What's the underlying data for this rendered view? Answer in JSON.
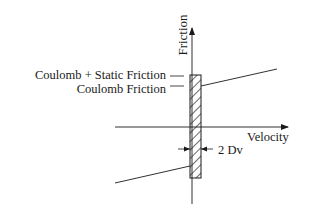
{
  "diagram": {
    "axes": {
      "y_label": "Friction",
      "x_label": "Velocity"
    },
    "labels": {
      "coulomb_static": "Coulomb + Static Friction",
      "coulomb": "Coulomb Friction",
      "band_width": "2 Dv"
    },
    "colors": {
      "ink": "#1a1a1a",
      "background": "#ffffff"
    }
  }
}
